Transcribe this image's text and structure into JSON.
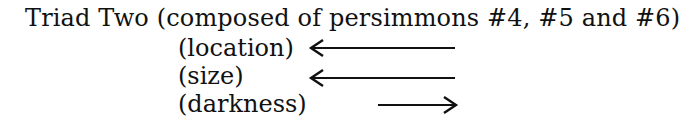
{
  "title": "Triad Two (composed of persimmons #4, #5 and #6)",
  "rows": [
    {
      "label": "(location)",
      "arrow_direction": "left"
    },
    {
      "label": "(size)",
      "arrow_direction": "left"
    },
    {
      "label": "(darkness)",
      "arrow_direction": "right"
    }
  ]
}
